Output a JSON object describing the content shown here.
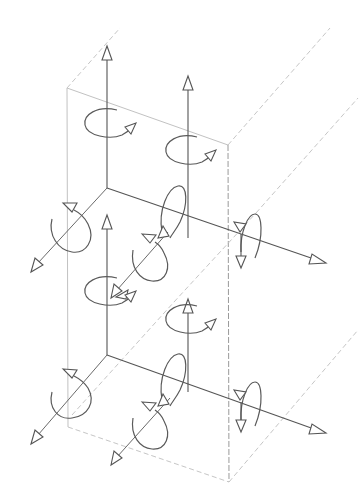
{
  "diagram": {
    "title": "",
    "colors": {
      "background": "#ffffff",
      "box_edges": "#c2c2c2",
      "axes": "#555555",
      "rotation_arcs": "#5a5a5a"
    },
    "box": {
      "front_face": {
        "top_left": [
          67,
          88
        ],
        "top_right": [
          228,
          145
        ],
        "bottom_right": [
          229,
          482
        ],
        "bottom_left": [
          68,
          427
        ]
      },
      "back_edges": [
        {
          "from": [
            67,
            88
          ],
          "to": [
            120,
            28
          ]
        },
        {
          "from": [
            228,
            145
          ],
          "to": [
            330,
            28
          ]
        },
        {
          "from": [
            229,
            482
          ],
          "to": [
            358,
            330
          ]
        },
        {
          "from": [
            72,
            415
          ],
          "to": [
            358,
            98
          ]
        }
      ]
    },
    "nodes": [
      {
        "id": "upper",
        "origin": [
          107,
          188
        ],
        "translations": [
          "up",
          "right",
          "out"
        ],
        "rotations": [
          "about-vertical",
          "about-right-axis",
          "about-out-axis"
        ]
      },
      {
        "id": "lower",
        "origin": [
          107,
          355
        ],
        "translations": [
          "up",
          "right",
          "out"
        ],
        "rotations": [
          "about-vertical",
          "about-right-axis",
          "about-out-axis"
        ]
      }
    ],
    "labels": []
  }
}
